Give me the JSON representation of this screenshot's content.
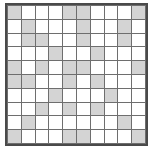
{
  "figure": {
    "name": "grid-pattern",
    "rows": 10,
    "columns": 10,
    "filled_color": "#d4d4d4",
    "empty_color": "#ffffff",
    "gridline_color": "#6e6e6e",
    "border_color": "#4a4a4a"
  },
  "chart_data": {
    "type": "heatmap",
    "title": "",
    "xlabel": "",
    "ylabel": "",
    "categories": [
      "1",
      "2",
      "3",
      "4",
      "5",
      "6",
      "7",
      "8",
      "9",
      "10"
    ],
    "row_labels": [
      "1",
      "2",
      "3",
      "4",
      "5",
      "6",
      "7",
      "8",
      "9",
      "10"
    ],
    "legend": [],
    "grid": true,
    "values": [
      [
        1,
        0,
        0,
        0,
        1,
        1,
        0,
        0,
        0,
        1
      ],
      [
        0,
        1,
        0,
        0,
        0,
        1,
        0,
        0,
        1,
        0
      ],
      [
        0,
        1,
        1,
        0,
        0,
        1,
        0,
        0,
        1,
        0
      ],
      [
        0,
        0,
        0,
        1,
        0,
        0,
        1,
        0,
        0,
        0
      ],
      [
        1,
        0,
        1,
        0,
        1,
        1,
        0,
        0,
        0,
        1
      ],
      [
        1,
        1,
        0,
        0,
        1,
        0,
        1,
        0,
        0,
        0
      ],
      [
        0,
        0,
        0,
        1,
        0,
        0,
        0,
        1,
        0,
        0
      ],
      [
        0,
        0,
        1,
        0,
        1,
        0,
        1,
        0,
        0,
        0
      ],
      [
        0,
        1,
        0,
        0,
        0,
        0,
        0,
        0,
        1,
        0
      ],
      [
        1,
        0,
        0,
        0,
        1,
        1,
        0,
        0,
        0,
        1
      ]
    ]
  }
}
